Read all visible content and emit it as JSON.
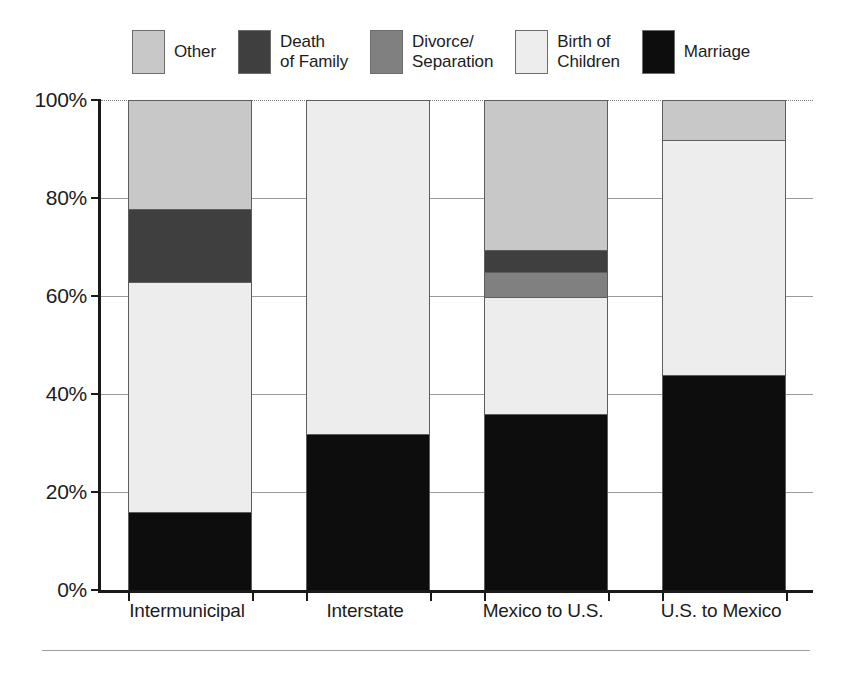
{
  "chart_data": {
    "type": "bar",
    "subtype": "stacked-bar-100-percent",
    "title": "",
    "subtitle": "",
    "xlabel": "",
    "ylabel": "",
    "ylim": [
      0,
      100
    ],
    "yticks": [
      "0%",
      "20%",
      "40%",
      "60%",
      "80%",
      "100%"
    ],
    "ytick_values": [
      0,
      20,
      40,
      60,
      80,
      100
    ],
    "grid": true,
    "legend_position": "top",
    "stack_order_bottom_to_top": [
      "Marriage",
      "Birth of Children",
      "Divorce/Separation",
      "Death of Family",
      "Other"
    ],
    "categories": [
      "Intermunicipal",
      "Interstate",
      "Mexico to U.S.",
      "U.S. to Mexico"
    ],
    "series": [
      {
        "name": "Marriage",
        "color": "#0d0d0d",
        "values": [
          16,
          32,
          36,
          44
        ]
      },
      {
        "name": "Birth of Children",
        "color": "#ededed",
        "values": [
          47,
          68,
          24,
          48
        ]
      },
      {
        "name": "Divorce/Separation",
        "color": "#808080",
        "values": [
          0,
          0,
          5,
          0
        ]
      },
      {
        "name": "Death of Family",
        "color": "#3f3f3f",
        "values": [
          15,
          0,
          4.5,
          0
        ]
      },
      {
        "name": "Other",
        "color": "#c8c8c8",
        "values": [
          22,
          0,
          30.5,
          8
        ]
      }
    ]
  },
  "legend": {
    "items": [
      {
        "label": "Other",
        "color": "#c8c8c8"
      },
      {
        "label": "Death\nof Family",
        "color": "#3f3f3f"
      },
      {
        "label": "Divorce/\nSeparation",
        "color": "#808080"
      },
      {
        "label": "Birth of\nChildren",
        "color": "#ededed"
      },
      {
        "label": "Marriage",
        "color": "#0d0d0d"
      }
    ]
  },
  "axis": {
    "y_tick_labels": [
      "100%",
      "80%",
      "60%",
      "40%",
      "20%",
      "0%"
    ],
    "x_tick_labels": [
      "Intermunicipal",
      "Interstate",
      "Mexico to U.S.",
      "U.S. to Mexico"
    ]
  }
}
